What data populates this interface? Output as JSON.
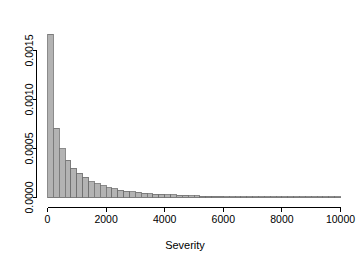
{
  "chart_data": {
    "type": "bar",
    "title": "",
    "subtitle": "",
    "xlabel": "Severity",
    "ylabel": "",
    "grid": false,
    "legend": false,
    "xlim": [
      0,
      10000
    ],
    "ylim": [
      0,
      0.00168
    ],
    "xticks": [
      0,
      2000,
      4000,
      6000,
      8000,
      10000
    ],
    "xticklabels": [
      "0",
      "2000",
      "4000",
      "6000",
      "8000",
      "10000"
    ],
    "yticks": [
      0.0,
      0.0005,
      0.001,
      0.0015
    ],
    "yticklabels": [
      "0.0000",
      "0.0005",
      "0.0010",
      "0.0015"
    ],
    "bin_width": 200,
    "bin_starts": [
      0,
      200,
      400,
      600,
      800,
      1000,
      1200,
      1400,
      1600,
      1800,
      2000,
      2200,
      2400,
      2600,
      2800,
      3000,
      3200,
      3400,
      3600,
      3800,
      4000,
      4200,
      4400,
      4600,
      4800,
      5000,
      5200,
      5400,
      5600,
      5800,
      6000,
      6200,
      6400,
      6600,
      6800,
      7000,
      7200,
      7400,
      7600,
      7800,
      8000,
      8200,
      8400,
      8600,
      8800,
      9000,
      9200,
      9400,
      9600,
      9800
    ],
    "values": [
      0.001665,
      0.000705,
      0.0005,
      0.000378,
      0.000298,
      0.000248,
      0.000205,
      0.00016,
      0.00014,
      0.000118,
      0.0001,
      8.8e-05,
      7.4e-05,
      6.6e-05,
      5.8e-05,
      5.2e-05,
      4.4e-05,
      4e-05,
      3.5e-05,
      3.1e-05,
      2.8e-05,
      2.6e-05,
      2.4e-05,
      2.1e-05,
      1.9e-05,
      1.7e-05,
      1.5e-05,
      1.4e-05,
      1.2e-05,
      1.1e-05,
      1e-05,
      9e-06,
      8e-06,
      8e-06,
      7e-06,
      6e-06,
      6e-06,
      5e-06,
      5e-06,
      4e-06,
      4e-06,
      4e-06,
      3e-06,
      3e-06,
      3e-06,
      2e-06,
      2e-06,
      2e-06,
      2e-06,
      2e-06
    ],
    "colors": {
      "bar_fill": "#b3b3b3",
      "bar_stroke": "#6e6e6e",
      "axis": "#000000",
      "background": "#ffffff"
    }
  }
}
